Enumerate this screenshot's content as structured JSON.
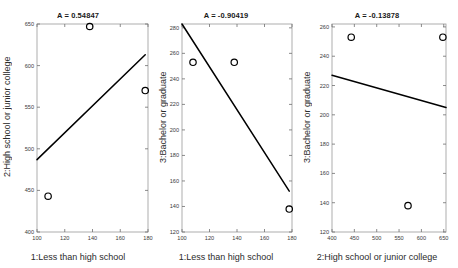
{
  "figure": {
    "background": "#ffffff",
    "marker_color": "#000000",
    "line_color": "#000000",
    "axis_color": "#9a9a9a"
  },
  "chart_data": [
    {
      "type": "scatter",
      "title": "A = 0.54847",
      "xlabel": "1:Less than high school",
      "ylabel": "2:High school or junior college",
      "xlim": [
        100,
        180
      ],
      "ylim": [
        400,
        650
      ],
      "xticks": [
        100,
        120,
        140,
        160,
        180
      ],
      "yticks": [
        400,
        450,
        500,
        550,
        600,
        650
      ],
      "grid": false,
      "points": [
        {
          "x": 108,
          "y": 443
        },
        {
          "x": 138,
          "y": 647
        },
        {
          "x": 178,
          "y": 570
        }
      ],
      "fit_line": {
        "x": [
          100,
          178
        ],
        "y": [
          487,
          613
        ]
      },
      "correlation": 0.54847
    },
    {
      "type": "scatter",
      "title": "A = -0.90419",
      "xlabel": "1:Less than high school",
      "ylabel": "3:Bachelor or graduate",
      "xlim": [
        100,
        180
      ],
      "ylim": [
        120,
        283
      ],
      "xticks": [
        100,
        120,
        140,
        160,
        180
      ],
      "yticks": [
        120,
        140,
        160,
        180,
        200,
        220,
        240,
        260,
        280
      ],
      "grid": false,
      "points": [
        {
          "x": 108,
          "y": 253
        },
        {
          "x": 138,
          "y": 253
        },
        {
          "x": 178,
          "y": 138
        }
      ],
      "fit_line": {
        "x": [
          100,
          178
        ],
        "y": [
          283,
          152
        ]
      },
      "correlation": -0.90419
    },
    {
      "type": "scatter",
      "title": "A = -0.13878",
      "xlabel": "2:High school or junior college",
      "ylabel": "3:Bachelor or graduate",
      "xlim": [
        400,
        655
      ],
      "ylim": [
        120,
        262
      ],
      "xticks": [
        400,
        450,
        500,
        550,
        600,
        650
      ],
      "yticks": [
        120,
        140,
        160,
        180,
        200,
        220,
        240,
        260
      ],
      "grid": false,
      "points": [
        {
          "x": 443,
          "y": 253
        },
        {
          "x": 648,
          "y": 253
        },
        {
          "x": 570,
          "y": 138
        }
      ],
      "fit_line": {
        "x": [
          400,
          655
        ],
        "y": [
          227,
          205
        ]
      },
      "correlation": -0.13878
    }
  ]
}
